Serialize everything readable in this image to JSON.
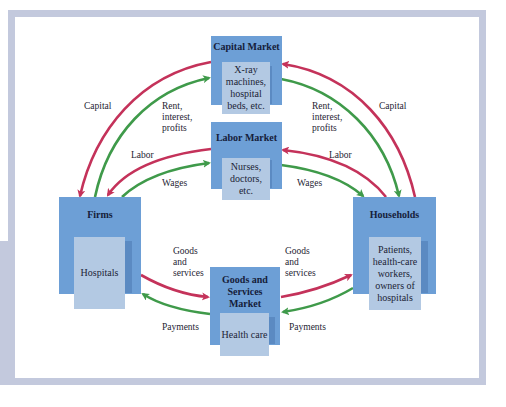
{
  "diagram": {
    "type": "circular-flow",
    "nodes": {
      "capital_market": {
        "title": "Capital Market",
        "detail": "X-ray machines, hospital beds, etc."
      },
      "labor_market": {
        "title": "Labor Market",
        "detail": "Nurses, doctors, etc."
      },
      "firms": {
        "title": "Firms",
        "detail": "Hospitals"
      },
      "households": {
        "title": "Households",
        "detail": "Patients, health-care workers, owners of hospitals"
      },
      "goods_market": {
        "title": "Goods and Services Market",
        "detail": "Health care"
      }
    },
    "flows": {
      "capital_left": "Capital",
      "rent_left": "Rent, interest, profits",
      "capital_right": "Capital",
      "rent_right": "Rent, interest, profits",
      "labor_left": "Labor",
      "wages_left": "Wages",
      "labor_right": "Labor",
      "wages_right": "Wages",
      "goods_left": "Goods and services",
      "payments_left": "Payments",
      "goods_right": "Goods and services",
      "payments_right": "Payments"
    },
    "colors": {
      "real_flow": "#c4325a",
      "money_flow": "#3f9a4a",
      "box_outer": "#6d9fd6",
      "box_inner": "#b3c9e3",
      "frame": "#c3c9dd"
    }
  }
}
